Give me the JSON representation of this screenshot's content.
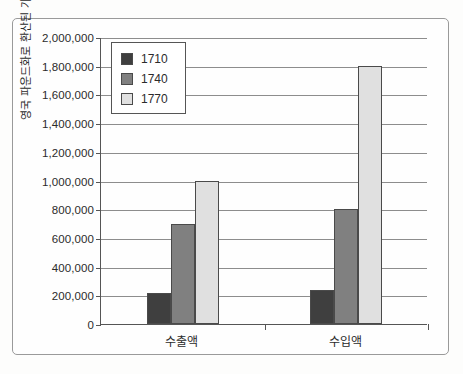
{
  "chart_data": {
    "type": "bar",
    "title": "",
    "subtitle": "",
    "xlabel": "",
    "ylabel": "영국 파운드화로 환산된 가치",
    "categories": [
      "수출액",
      "수입액"
    ],
    "series": [
      {
        "name": "1710",
        "values": [
          215000,
          235000
        ],
        "color": "#3f3f3f"
      },
      {
        "name": "1740",
        "values": [
          700000,
          800000
        ],
        "color": "#808080"
      },
      {
        "name": "1770",
        "values": [
          1000000,
          1800000
        ],
        "color": "#e0e0e0"
      }
    ],
    "ylim": [
      0,
      2000000
    ],
    "ytick_step": 200000,
    "ytick_labels": [
      "0",
      "200,000",
      "400,000",
      "600,000",
      "800,000",
      "1,000,000",
      "1,200,000",
      "1,400,000",
      "1,600,000",
      "1,800,000",
      "2,000,000"
    ],
    "grid": true,
    "legend_position": "top-left-inside",
    "bar_outline_color": "#4a4a4a",
    "axis_color": "#555555",
    "grid_color": "#8d8d8d",
    "background_color": "#fefefe"
  },
  "legend": {
    "entries": [
      {
        "label": "1710",
        "color": "#3f3f3f"
      },
      {
        "label": "1740",
        "color": "#808080"
      },
      {
        "label": "1770",
        "color": "#e0e0e0"
      }
    ]
  }
}
